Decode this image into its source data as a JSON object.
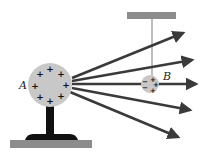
{
  "diagram": {
    "labels": {
      "sphere_a": "A",
      "ball_b": "B"
    },
    "sphere_a": {
      "charge_symbol": "+",
      "charges": [
        {
          "x": 50,
          "y": 69
        },
        {
          "x": 40,
          "y": 74
        },
        {
          "x": 61,
          "y": 74
        },
        {
          "x": 35,
          "y": 86
        },
        {
          "x": 66,
          "y": 85
        },
        {
          "x": 40,
          "y": 97
        },
        {
          "x": 61,
          "y": 96
        },
        {
          "x": 50,
          "y": 101
        }
      ]
    },
    "ball_b": {
      "left_charge_symbol": "−",
      "right_charge_symbol": "+",
      "left_charges": [
        {
          "x": 145,
          "y": 81
        },
        {
          "x": 145,
          "y": 87
        }
      ],
      "right_charges": [
        {
          "x": 153,
          "y": 79
        },
        {
          "x": 156,
          "y": 84
        },
        {
          "x": 153,
          "y": 90
        }
      ]
    },
    "field_lines": [
      {
        "x1": 72,
        "y1": 78,
        "x2": 183,
        "y2": 33
      },
      {
        "x1": 72,
        "y1": 81,
        "x2": 192,
        "y2": 60
      },
      {
        "x1": 72,
        "y1": 84,
        "x2": 196,
        "y2": 84
      },
      {
        "x1": 72,
        "y1": 88,
        "x2": 190,
        "y2": 110
      },
      {
        "x1": 70,
        "y1": 92,
        "x2": 178,
        "y2": 137
      }
    ],
    "colors": {
      "sphere_fill": "#c8c8c8",
      "support_fill": "#8c8c8c",
      "arrow": "#3a3a3a",
      "stand": "#111111"
    }
  }
}
